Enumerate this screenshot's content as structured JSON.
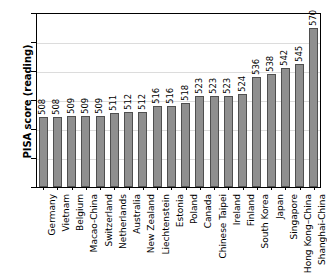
{
  "chart_data": {
    "type": "bar",
    "title": "",
    "subtitle": "",
    "xlabel": "",
    "ylabel": "PISA score (reading)",
    "ylim": [
      460,
      580
    ],
    "yticks": [
      460,
      480,
      500,
      520,
      540,
      560,
      580
    ],
    "grid": true,
    "legend": false,
    "orientation": "vertical",
    "bar_color": "#8f8f8f",
    "bar_edge_color": "#4f4f4f",
    "grid_color": "#dcdcdc",
    "axis_color": "#000000",
    "value_labels_rotated": true,
    "category_labels_rotated": true,
    "categories": [
      "Germany",
      "Vietnam",
      "Belgium",
      "Macao-China",
      "Switzerland",
      "Netherlands",
      "Australia",
      "New Zealand",
      "Liechtenstein",
      "Estonia",
      "Poland",
      "Canada",
      "Chinese Taipei",
      "Ireland",
      "Finland",
      "South Korea",
      "Japan",
      "Singapore",
      "Hong Kong–China",
      "Shanghai-China"
    ],
    "values": [
      508,
      508,
      509,
      509,
      509,
      511,
      512,
      512,
      516,
      516,
      518,
      523,
      523,
      523,
      524,
      536,
      538,
      542,
      545,
      570
    ],
    "value_labels": [
      "508",
      "508",
      "509",
      "509",
      "509",
      "511",
      "512",
      "512",
      "516",
      "516",
      "518",
      "523",
      "523",
      "523",
      "524",
      "536",
      "538",
      "542",
      "545",
      "570"
    ],
    "ytick_labels": [
      "460",
      "480",
      "500",
      "520",
      "540",
      "560",
      "580"
    ]
  }
}
